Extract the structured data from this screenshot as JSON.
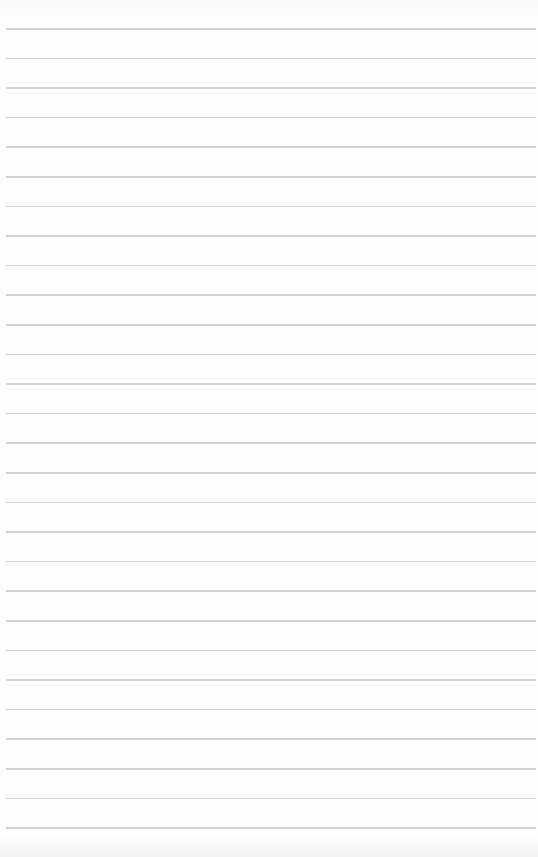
{
  "page": {
    "type": "lined-paper",
    "background_color": "#fcfcfc",
    "rule_color": "#c9c9c9",
    "rule_count": 28,
    "first_rule_y": 28,
    "rule_spacing": 29.6
  }
}
